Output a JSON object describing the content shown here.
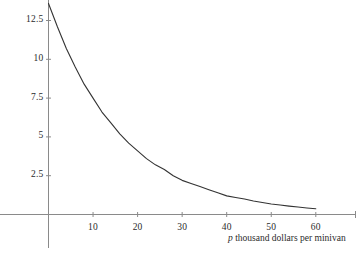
{
  "chart_data": {
    "type": "line",
    "title": "",
    "xlabel": "p thousand dollars per minivan",
    "xlabel_variable": "p",
    "xlabel_rest": " thousand dollars per minivan",
    "ylabel": "",
    "xticks": [
      10,
      20,
      30,
      40,
      50,
      60
    ],
    "xtick_labels": [
      "10",
      "20",
      "30",
      "40",
      "50",
      "60"
    ],
    "yticks": [
      2.5,
      5,
      7.5,
      10,
      12.5
    ],
    "ytick_labels": [
      "2.5",
      "5",
      "7.5",
      "10",
      "12.5"
    ],
    "xlim": [
      0,
      68
    ],
    "ylim": [
      0,
      14.3
    ],
    "grid": false,
    "legend": null,
    "series": [
      {
        "name": "demand",
        "comment": "exponential decay curve of quantity versus price",
        "x": [
          0,
          2,
          4,
          6,
          8,
          10,
          12,
          14,
          16,
          18,
          20,
          22,
          24,
          26,
          28,
          30,
          32,
          34,
          36,
          38,
          40,
          42,
          44,
          46,
          48,
          50,
          52,
          54,
          56,
          58,
          60
        ],
        "y": [
          13.6,
          12.1,
          10.7,
          9.5,
          8.4,
          7.5,
          6.6,
          5.9,
          5.2,
          4.6,
          4.1,
          3.6,
          3.2,
          2.9,
          2.5,
          2.2,
          2.0,
          1.8,
          1.6,
          1.4,
          1.2,
          1.1,
          1.0,
          0.87,
          0.77,
          0.68,
          0.61,
          0.54,
          0.48,
          0.42,
          0.37
        ]
      }
    ],
    "colors": {
      "curve": "#333333",
      "axis": "#8a8a8a",
      "text": "#2b2b2b",
      "background": "#ffffff"
    }
  },
  "axes": {
    "x_axis_name": "horizontal-price-axis",
    "y_axis_name": "vertical-quantity-axis"
  }
}
